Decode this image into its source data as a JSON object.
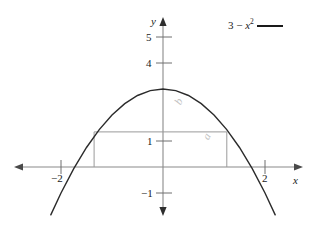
{
  "chart_data": {
    "type": "line",
    "title": "",
    "xlabel": "x",
    "ylabel": "y",
    "xlim": [
      -2.6,
      2.6
    ],
    "ylim": [
      -1.6,
      5.4
    ],
    "grid": false,
    "legend_position": "top-right",
    "series": [
      {
        "name": "3 - x^2",
        "expression": "3 - x²",
        "color": "#1a1a1a",
        "x": [
          -2.2,
          -2.0,
          -1.75,
          -1.5,
          -1.25,
          -1.0,
          -0.75,
          -0.5,
          -0.25,
          0,
          0.25,
          0.5,
          0.75,
          1.0,
          1.25,
          1.5,
          1.75,
          2.0,
          2.2
        ],
        "y": [
          -1.84,
          -1.0,
          -0.0625,
          0.75,
          1.4375,
          2.0,
          2.4375,
          2.75,
          2.9375,
          3.0,
          2.9375,
          2.75,
          2.4375,
          2.0,
          1.4375,
          0.75,
          -0.0625,
          -1.0,
          -1.84
        ]
      }
    ],
    "x_ticks": [
      {
        "value": -2,
        "label": "−2"
      },
      {
        "value": 2,
        "label": "2"
      }
    ],
    "y_ticks": [
      {
        "value": 5,
        "label": "5"
      },
      {
        "value": 4,
        "label": "4"
      },
      {
        "value": 1,
        "label": "1"
      },
      {
        "value": -1,
        "label": "−1"
      }
    ],
    "annotations": {
      "inscribed_rectangle": {
        "x_left": -1.35,
        "x_right": 1.25,
        "y_bottom": 0,
        "y_top": 1.35,
        "color": "#9a9a9a",
        "width_label": "b",
        "height_label": "a"
      }
    }
  },
  "legend": {
    "prefix": "3 − ",
    "variable": "x",
    "exponent": "2"
  },
  "axes": {
    "x_name": "x",
    "y_name": "y"
  },
  "labels": {
    "y5": "5",
    "y4": "4",
    "y1": "1",
    "yneg1": "−1",
    "xneg2": "−2",
    "x2": "2",
    "rect_width": "b",
    "rect_height": "a"
  }
}
